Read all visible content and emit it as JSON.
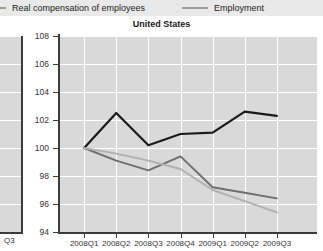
{
  "legend": {
    "items": [
      {
        "label": "Real compensation of employees",
        "color": "#9d9d9d",
        "icon": "line-swatch"
      },
      {
        "label": "Employment",
        "color": "#9d9d9d",
        "icon": "line-swatch"
      }
    ]
  },
  "left_panel": {
    "clipped_tick_label": "Q3"
  },
  "chart_data": {
    "type": "line",
    "title": "United States",
    "subtitle": "",
    "xlabel": "",
    "ylabel": "",
    "categories": [
      "2008Q1",
      "2008Q2",
      "2008Q3",
      "2008Q4",
      "2009Q1",
      "2009Q2",
      "2009Q3"
    ],
    "ylim": [
      94,
      108
    ],
    "yticks": [
      94,
      96,
      98,
      100,
      102,
      104,
      106,
      108
    ],
    "ytick_labels": [
      "94",
      "96",
      "98",
      "100",
      "102",
      "104",
      "106",
      "108"
    ],
    "grid": true,
    "grid_color": "#ffffff",
    "plot_background": "#d9d9d9",
    "legend_position": "top",
    "series": [
      {
        "name": "GDP",
        "color": "#1a1a1a",
        "width": 2.2,
        "values": [
          100.0,
          102.5,
          100.2,
          101.0,
          101.1,
          102.6,
          102.3
        ]
      },
      {
        "name": "Real compensation of employees",
        "color": "#6e6e6e",
        "width": 1.9,
        "values": [
          100.0,
          99.1,
          98.4,
          99.4,
          97.2,
          96.8,
          96.4
        ]
      },
      {
        "name": "Employment",
        "color": "#b0b0b0",
        "width": 1.9,
        "values": [
          100.0,
          99.6,
          99.1,
          98.5,
          97.0,
          96.2,
          95.4
        ]
      }
    ]
  }
}
